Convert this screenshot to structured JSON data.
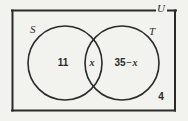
{
  "figure": {
    "kind": "venn-diagram",
    "background_color": "#f2f2ee",
    "stroke_color": "#2b2b2b"
  },
  "universe": {
    "label": "U",
    "outside_count": "4"
  },
  "sets": [
    {
      "key": "S",
      "label": "S",
      "only_region_value": "11"
    },
    {
      "key": "T",
      "label": "T",
      "only_region_value": "35 − x"
    }
  ],
  "regions": {
    "s_only": "11",
    "intersection": "x",
    "t_only_number": "35",
    "t_only_operator": "−",
    "t_only_variable": "x",
    "outside": "4"
  }
}
